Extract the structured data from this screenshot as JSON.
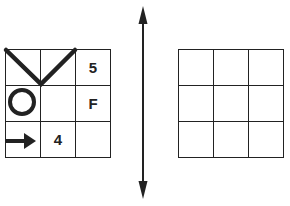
{
  "left_grid": {
    "cells": [
      {
        "row": 0,
        "col": 0,
        "content": "",
        "symbol": "v-line-left"
      },
      {
        "row": 0,
        "col": 1,
        "content": "",
        "symbol": "v-line-right"
      },
      {
        "row": 0,
        "col": 2,
        "content": "5"
      },
      {
        "row": 1,
        "col": 0,
        "content": "",
        "symbol": "circle-icon"
      },
      {
        "row": 1,
        "col": 1,
        "content": ""
      },
      {
        "row": 1,
        "col": 2,
        "content": "F"
      },
      {
        "row": 2,
        "col": 0,
        "content": "",
        "symbol": "arrow-right-icon"
      },
      {
        "row": 2,
        "col": 1,
        "content": "4"
      },
      {
        "row": 2,
        "col": 2,
        "content": ""
      }
    ]
  },
  "separator": {
    "symbol": "double-headed-vertical-arrow"
  },
  "right_grid": {
    "cells": [
      "",
      "",
      "",
      "",
      "",
      "",
      "",
      "",
      ""
    ]
  },
  "colors": {
    "stroke": "#222222",
    "background": "#ffffff"
  }
}
